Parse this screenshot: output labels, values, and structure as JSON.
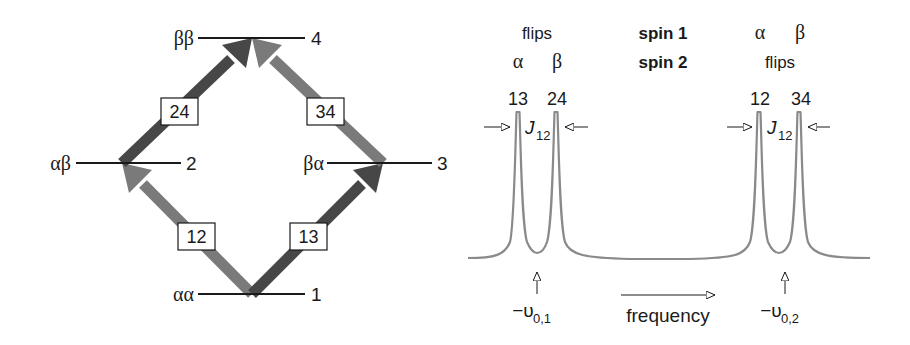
{
  "energy_diagram": {
    "levels": [
      {
        "id": 4,
        "state": "ββ",
        "number": "4"
      },
      {
        "id": 2,
        "state": "αβ",
        "number": "2"
      },
      {
        "id": 3,
        "state": "βα",
        "number": "3"
      },
      {
        "id": 1,
        "state": "αα",
        "number": "1"
      }
    ],
    "transitions": [
      {
        "label": "12",
        "from": 1,
        "to": 2,
        "shade": "light",
        "color": "#7a7a7a"
      },
      {
        "label": "13",
        "from": 1,
        "to": 3,
        "shade": "dark",
        "color": "#474747"
      },
      {
        "label": "24",
        "from": 2,
        "to": 4,
        "shade": "dark",
        "color": "#474747"
      },
      {
        "label": "34",
        "from": 3,
        "to": 4,
        "shade": "light",
        "color": "#7a7a7a"
      }
    ]
  },
  "spectrum": {
    "legend": {
      "row1_label": "spin 1",
      "row2_label": "spin 2"
    },
    "left_multiplet": {
      "flips_label": "flips",
      "alpha_label": "α",
      "beta_label": "β",
      "peak_labels": [
        "13",
        "24"
      ],
      "coupling_label": "J",
      "coupling_sub": "12",
      "center_label": "−υ",
      "center_sub": "0,1"
    },
    "right_multiplet": {
      "alpha_label": "α",
      "beta_label": "β",
      "flips_label": "flips",
      "peak_labels": [
        "12",
        "34"
      ],
      "coupling_label": "J",
      "coupling_sub": "12",
      "center_label": "−υ",
      "center_sub": "0,2"
    },
    "axis_label": "frequency",
    "line_color": "#8a8a8a"
  }
}
